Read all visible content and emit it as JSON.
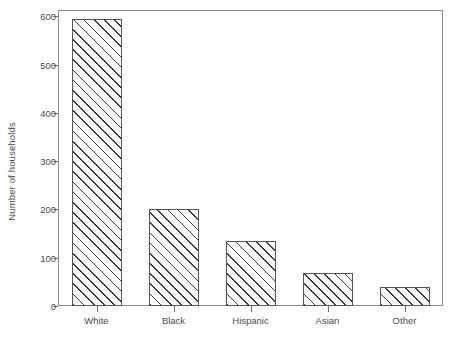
{
  "chart_data": {
    "type": "bar",
    "title": "",
    "xlabel": "",
    "ylabel": "Number of households",
    "categories": [
      "White",
      "Black",
      "Hispanic",
      "Asian",
      "Other"
    ],
    "values": [
      595,
      200,
      134,
      68,
      40
    ],
    "yticks": [
      0,
      100,
      200,
      300,
      400,
      500,
      600
    ],
    "ytick_labels": [
      "0",
      "100",
      "200",
      "300",
      "400",
      "500",
      "600"
    ],
    "ylim": [
      0,
      613
    ],
    "grid": false,
    "legend": null,
    "bar_style": {
      "fill": "#ffffff",
      "hatch": "diagonal-45",
      "hatch_color": "#3a3a3a",
      "edge_color": "#555555"
    },
    "frame_color": "#8a8a8a",
    "text_color": "#4a4a4a",
    "background": "#ffffff"
  }
}
